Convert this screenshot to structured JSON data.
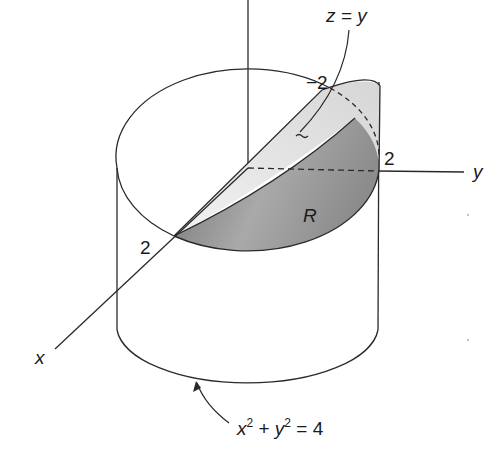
{
  "figure": {
    "type": "3d-solid-diagram",
    "labels": {
      "plane": "z = y",
      "neg_two": "−2",
      "y_two": "2",
      "x_two": "2",
      "region": "R",
      "axis_y": "y",
      "axis_x": "x",
      "cylinder_eq_x": "x",
      "cylinder_eq_sup1": "2",
      "cylinder_eq_plus": " + ",
      "cylinder_eq_y": "y",
      "cylinder_eq_sup2": "2",
      "cylinder_eq_rhs": " = 4"
    },
    "colors": {
      "stroke": "#2a2a2a",
      "plane_fill": "#e4e4e4",
      "region_fill_dark": "#8a8a8a",
      "region_fill_light": "#c8c8c8",
      "background": "#ffffff"
    }
  }
}
